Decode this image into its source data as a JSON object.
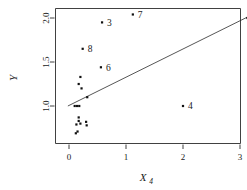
{
  "chart_data": {
    "type": "scatter",
    "title": "",
    "xlabel": "X_4",
    "xlabel_base": "X",
    "xlabel_sub": "4",
    "ylabel": "Y",
    "xlim": [
      -0.18,
      3.2
    ],
    "ylim": [
      0.62,
      2.1
    ],
    "grid": false,
    "legend": null,
    "xticks": [
      0,
      1,
      2,
      3
    ],
    "xticklabels": [
      "0",
      "1",
      "2",
      "3"
    ],
    "yticks": [
      1.0,
      1.5,
      2.0
    ],
    "yticklabels": [
      "1.0",
      "1.5",
      "2.0"
    ],
    "marker": "filled-square",
    "marker_color": "#111111",
    "line_color": "#2b2b2b",
    "points": [
      {
        "x": 1.12,
        "y": 2.04,
        "label": "7"
      },
      {
        "x": 0.58,
        "y": 1.95,
        "label": "3"
      },
      {
        "x": 3.13,
        "y": 2.0,
        "label": "5"
      },
      {
        "x": 0.24,
        "y": 1.65,
        "label": "8"
      },
      {
        "x": 0.56,
        "y": 1.44,
        "label": "6"
      },
      {
        "x": 2.0,
        "y": 1.0,
        "label": "4"
      },
      {
        "x": 0.2,
        "y": 1.33,
        "label": ""
      },
      {
        "x": 0.17,
        "y": 1.25,
        "label": ""
      },
      {
        "x": 0.22,
        "y": 1.2,
        "label": ""
      },
      {
        "x": 0.32,
        "y": 1.1,
        "label": ""
      },
      {
        "x": 0.1,
        "y": 1.0,
        "label": ""
      },
      {
        "x": 0.14,
        "y": 1.0,
        "label": ""
      },
      {
        "x": 0.18,
        "y": 1.0,
        "label": ""
      },
      {
        "x": 0.17,
        "y": 0.87,
        "label": ""
      },
      {
        "x": 0.17,
        "y": 0.83,
        "label": ""
      },
      {
        "x": 0.13,
        "y": 0.79,
        "label": ""
      },
      {
        "x": 0.2,
        "y": 0.8,
        "label": ""
      },
      {
        "x": 0.3,
        "y": 0.82,
        "label": ""
      },
      {
        "x": 0.31,
        "y": 0.78,
        "label": ""
      },
      {
        "x": 0.15,
        "y": 0.71,
        "label": ""
      },
      {
        "x": 0.12,
        "y": 0.69,
        "label": ""
      }
    ],
    "fit_line": {
      "x0": -0.02,
      "y0": 1.0,
      "x1": 3.16,
      "y1": 2.02
    }
  }
}
